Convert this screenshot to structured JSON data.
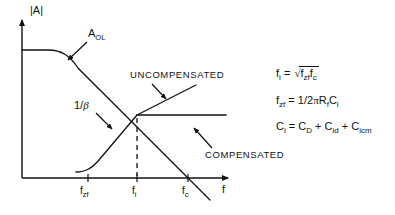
{
  "figure": {
    "type": "line",
    "title": "",
    "axes": {
      "y_label": "|A|",
      "x_label": "f",
      "x_ticks": [
        {
          "id": "f_zf",
          "base": "f",
          "sub": "zf",
          "x_px": 88
        },
        {
          "id": "f_i",
          "base": "f",
          "sub": "i",
          "x_px": 137
        },
        {
          "id": "f_c",
          "base": "f",
          "sub": "c",
          "x_px": 188
        }
      ],
      "grid": false
    },
    "curves": [
      {
        "name": "open-loop-gain",
        "label_base": "A",
        "label_sub": "OL",
        "description": "Flat open-loop gain rolling off with single-pole slope, crossing the frequency axis at f_c"
      },
      {
        "name": "uncompensated-noise-gain",
        "label": "UNCOMPENSATED",
        "description": "1/beta rising with +slope through the intersection at f_i and continuing upward"
      },
      {
        "name": "compensated-noise-gain",
        "label": "COMPENSATED",
        "description": "1/beta flattening after the intersection at f_i"
      },
      {
        "name": "noise-gain-low-frequency",
        "label": "1/β",
        "description": "Low frequency 1/beta plateau breaking upward at f_zf"
      }
    ],
    "intersection": {
      "label": "f_i",
      "x_px": 137,
      "y_px": 115
    }
  },
  "labels": {
    "y_axis": "|A|",
    "x_axis": "f",
    "a_ol_base": "A",
    "a_ol_sub": "OL",
    "uncompensated": "UNCOMPENSATED",
    "compensated": "COMPENSATED",
    "one_over_beta_num": "1/",
    "one_over_beta_sym": "β",
    "tick_f_zf_base": "f",
    "tick_f_zf_sub": "zf",
    "tick_f_i_base": "f",
    "tick_f_i_sub": "i",
    "tick_f_c_base": "f",
    "tick_f_c_sub": "c"
  },
  "equations": [
    {
      "id": "f-i-equation",
      "lhs_base": "f",
      "lhs_sub": "i",
      "eq": "=",
      "radical": "√",
      "radicand_terms": [
        {
          "base": "f",
          "sub": "zf"
        },
        {
          "base": "f",
          "sub": "c"
        }
      ]
    },
    {
      "id": "f-zf-equation",
      "lhs_base": "f",
      "lhs_sub": "zf",
      "eq": "=",
      "rhs_prefix": "1/2",
      "rhs_pi": "π",
      "rhs_terms": [
        {
          "base": "R",
          "sub": "f"
        },
        {
          "base": "C",
          "sub": "i"
        }
      ]
    },
    {
      "id": "c-i-equation",
      "lhs_base": "C",
      "lhs_sub": "i",
      "eq": "=",
      "rhs_terms": [
        {
          "base": "C",
          "sub": "D"
        },
        {
          "op": "+",
          "base": "C",
          "sub": "id"
        },
        {
          "op": "+",
          "base": "C",
          "sub": "icm"
        }
      ]
    }
  ],
  "colors": {
    "ink": "#111111",
    "background": "#ffffff"
  }
}
